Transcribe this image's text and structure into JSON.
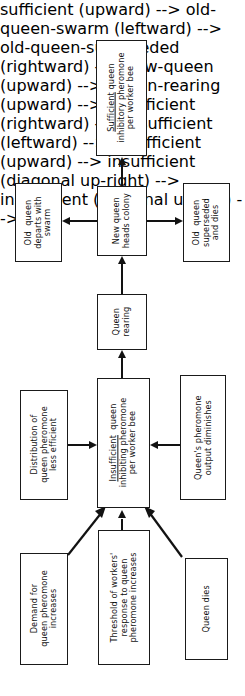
{
  "diagram": {
    "orientation": "rotated-90-ccw",
    "background_color": "#ffffff",
    "line_color": "#121212",
    "nodes": [
      {
        "id": "sufficient",
        "lines": [
          "Sufficient queen",
          "inhibitory pheromone",
          "per worker bee"
        ],
        "underline_first_word": "Sufficient",
        "text": "Sufficient queen\ninhibitory pheromone\nper worker bee"
      },
      {
        "id": "old-queen-swarm",
        "lines": [
          "Old  queen",
          "departs with",
          "swarm"
        ],
        "text": "Old  queen\ndeparts with\nswarm"
      },
      {
        "id": "new-queen",
        "lines": [
          "New queen",
          "heads colony"
        ],
        "text": "New queen\nheads colony"
      },
      {
        "id": "old-queen-superseded",
        "lines": [
          "Old  queen",
          "superseded",
          "and dies"
        ],
        "text": "Old  queen\nsuperseded\nand dies"
      },
      {
        "id": "queen-rearing",
        "lines": [
          "Queen",
          "rearing"
        ],
        "text": "Queen\nrearing"
      },
      {
        "id": "distribution",
        "lines": [
          "Distribution of",
          "queen pheromone",
          "less efficient"
        ],
        "text": "Distribution of\nqueen pheromone\nless efficient"
      },
      {
        "id": "insufficient",
        "lines": [
          "Insufficient  queen",
          "inhibiting pheromone",
          "per worker bee"
        ],
        "underline_first_word": "Insufficient",
        "text": "Insufficient  queen\ninhibiting pheromone\nper worker bee"
      },
      {
        "id": "queens-output",
        "lines": [
          "Queen's pheromone",
          "output diminishes"
        ],
        "text": "Queen's pheromone\noutput diminishes"
      },
      {
        "id": "demand",
        "lines": [
          "Demand for",
          "queen pheromone",
          "increases"
        ],
        "text": "Demand for\nqueen pheromone\nincreases"
      },
      {
        "id": "threshold",
        "lines": [
          "Threshold of workers'",
          "response to queen",
          "pheromone increases"
        ],
        "text": "Threshold of workers'\nresponse to queen\npheromone increases"
      },
      {
        "id": "queen-dies",
        "lines": [
          "Queen dies"
        ],
        "text": "Queen dies"
      }
    ],
    "edges": [
      {
        "from": "new-queen",
        "to": "sufficient",
        "style": "arrow"
      },
      {
        "from": "new-queen",
        "to": "old-queen-swarm",
        "style": "arrow"
      },
      {
        "from": "new-queen",
        "to": "old-queen-superseded",
        "style": "arrow"
      },
      {
        "from": "queen-rearing",
        "to": "new-queen",
        "style": "arrow"
      },
      {
        "from": "insufficient",
        "to": "queen-rearing",
        "style": "arrow"
      },
      {
        "from": "distribution",
        "to": "insufficient",
        "style": "arrow"
      },
      {
        "from": "queens-output",
        "to": "insufficient",
        "style": "arrow"
      },
      {
        "from": "demand",
        "to": "insufficient",
        "style": "arrow-diagonal"
      },
      {
        "from": "threshold",
        "to": "insufficient",
        "style": "arrow"
      },
      {
        "from": "queen-dies",
        "to": "insufficient",
        "style": "arrow-diagonal"
      }
    ]
  }
}
